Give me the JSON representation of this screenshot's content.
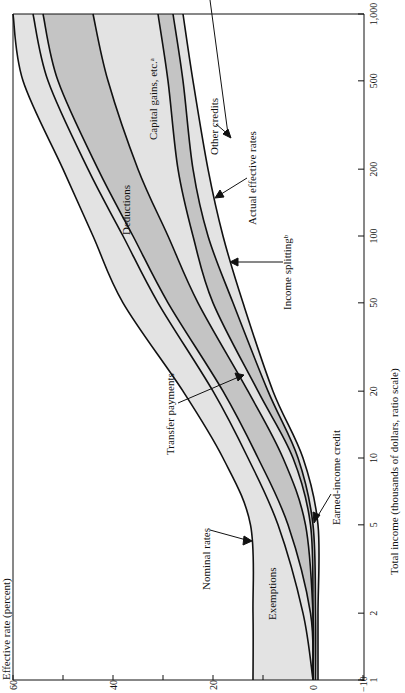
{
  "chart_data": {
    "type": "area",
    "title": "",
    "xlabel": "Total income (thousands of dollars, ratio scale)",
    "ylabel": "Effective rate (percent)",
    "x_scale": "log",
    "x": [
      1,
      2,
      5,
      10,
      20,
      50,
      100,
      200,
      500,
      1000
    ],
    "x_tick_labels": [
      "1",
      "2",
      "5",
      "10",
      "20",
      "50",
      "100",
      "200",
      "500",
      "1,000"
    ],
    "ylim": [
      -10,
      60
    ],
    "y_ticks": [
      -10,
      0,
      20,
      40,
      60
    ],
    "y_tick_labels": [
      "−10",
      "0",
      "20",
      "40",
      "60"
    ],
    "series": [
      {
        "name": "Nominal rates",
        "values": [
          12,
          12,
          12.5,
          18,
          26,
          38,
          44,
          50,
          58,
          60
        ]
      },
      {
        "name": "Exemptions / Transfer payments boundary",
        "values": [
          0,
          2,
          7,
          13,
          20,
          31,
          38,
          45,
          53,
          56
        ]
      },
      {
        "name": "Transfer payments / Deductions boundary",
        "values": [
          0,
          0.5,
          5,
          11,
          18,
          29,
          36,
          43,
          51,
          54
        ]
      },
      {
        "name": "Deductions / Capital gains boundary",
        "values": [
          0,
          0,
          1.5,
          6,
          13,
          23,
          29,
          35,
          41,
          44
        ]
      },
      {
        "name": "Capital gains / Income splitting boundary",
        "values": [
          0,
          0,
          0.5,
          4,
          11,
          20,
          24,
          27,
          29,
          31
        ]
      },
      {
        "name": "Income splitting / Other credits boundary",
        "values": [
          -0.5,
          -0.5,
          0,
          3,
          9,
          16,
          21,
          24,
          26,
          28
        ]
      },
      {
        "name": "Actual effective rates",
        "values": [
          -1,
          -1,
          -1,
          2,
          8,
          14,
          18,
          21,
          24,
          26
        ]
      }
    ],
    "bands": [
      {
        "name": "Exemptions",
        "between": [
          "Nominal rates",
          "Exemptions / Transfer payments boundary"
        ],
        "color": "#e3e3e3"
      },
      {
        "name": "Transfer payments",
        "between": [
          "Exemptions / Transfer payments boundary",
          "Transfer payments / Deductions boundary"
        ],
        "color": "#e3e3e3"
      },
      {
        "name": "Deductions",
        "between": [
          "Transfer payments / Deductions boundary",
          "Deductions / Capital gains boundary"
        ],
        "color": "#c4c4c4"
      },
      {
        "name": "Capital gains, etc.",
        "between": [
          "Deductions / Capital gains boundary",
          "Capital gains / Income splitting boundary"
        ],
        "color": "#e3e3e3"
      },
      {
        "name": "Income splitting",
        "between": [
          "Capital gains / Income splitting boundary",
          "Income splitting / Other credits boundary"
        ],
        "color": "#c4c4c4"
      },
      {
        "name": "Other credits",
        "between": [
          "Income splitting / Other credits boundary",
          "Actual effective rates"
        ],
        "color": "#e3e3e3"
      }
    ],
    "annotations": [
      {
        "text": "Nominal rates",
        "arrow": true
      },
      {
        "text": "Exemptions",
        "arrow": false
      },
      {
        "text": "Transfer payments",
        "arrow": true
      },
      {
        "text": "Deductions",
        "arrow": false
      },
      {
        "text": "Capital gains, etc.ᵃ",
        "arrow": false
      },
      {
        "text": "Income splittingᵇ",
        "arrow": true
      },
      {
        "text": "Other credits",
        "arrow": true
      },
      {
        "text": "Actual effective rates",
        "arrow": true
      },
      {
        "text": "Earned-income credit",
        "arrow": true
      }
    ],
    "grid": false,
    "orientation": "rotated 90° counterclockwise"
  },
  "labels": {
    "ylabel": "Effective rate (percent)",
    "xlabel": "Total income (thousands of dollars, ratio scale)",
    "nominal": "Nominal rates",
    "exemptions": "Exemptions",
    "transfer": "Transfer payments",
    "deductions": "Deductions",
    "capgains": "Capital gains, etc.ᵃ",
    "splitting": "Income splittingᵇ",
    "other": "Other credits",
    "actual": "Actual effective rates",
    "eic": "Earned-income credit"
  }
}
